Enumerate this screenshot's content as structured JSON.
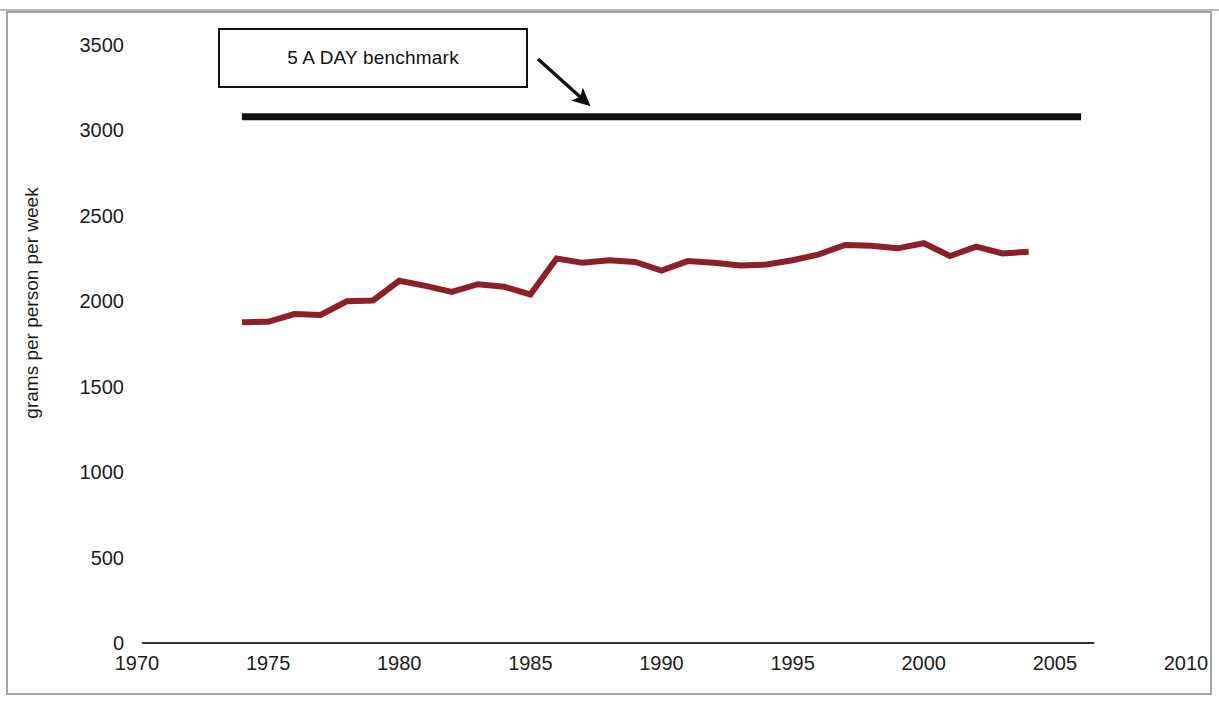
{
  "figure": {
    "background_color": "#ffffff",
    "frame_color": "#a6a6a6"
  },
  "annotation": {
    "callout_label": "5 A DAY benchmark",
    "arrow_name": "callout-arrow"
  },
  "chart_data": {
    "type": "line",
    "title": "",
    "subtitle": "",
    "xlabel": "",
    "ylabel": "grams per person per week",
    "xlim": [
      1970,
      2010
    ],
    "ylim": [
      0,
      3500
    ],
    "xticks": [
      1970,
      1975,
      1980,
      1985,
      1990,
      1995,
      2000,
      2005,
      2010
    ],
    "yticks": [
      0,
      500,
      1000,
      1500,
      2000,
      2500,
      3000,
      3500
    ],
    "grid": false,
    "legend": null,
    "annotations": [
      {
        "text": "5 A DAY benchmark",
        "type": "boxed-callout-with-arrow",
        "points_to": "benchmark-line"
      }
    ],
    "series": [
      {
        "name": "5 A DAY benchmark",
        "type": "line",
        "color": "#111111",
        "width": 7,
        "x": [
          1974,
          2006
        ],
        "values": [
          3080,
          3080
        ]
      },
      {
        "name": "Fruit and vegetable consumption",
        "type": "line",
        "color": "#8B2028",
        "width": 6,
        "x": [
          1974,
          1975,
          1976,
          1977,
          1978,
          1979,
          1980,
          1981,
          1982,
          1983,
          1984,
          1985,
          1986,
          1987,
          1988,
          1989,
          1990,
          1991,
          1992,
          1993,
          1994,
          1995,
          1996,
          1997,
          1998,
          1999,
          2000,
          2001,
          2002,
          2003,
          2004
        ],
        "values": [
          1878,
          1880,
          1925,
          1920,
          2000,
          2005,
          2120,
          2090,
          2055,
          2100,
          2085,
          2040,
          2250,
          2225,
          2240,
          2230,
          2180,
          2235,
          2225,
          2210,
          2215,
          2240,
          2275,
          2330,
          2325,
          2310,
          2340,
          2265,
          2320,
          2280,
          2290
        ]
      }
    ]
  }
}
